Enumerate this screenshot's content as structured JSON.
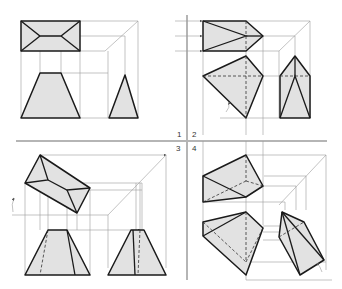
{
  "diagram": {
    "type": "orthographic-projection-steps",
    "quadrants": [
      {
        "id": 1,
        "label": "1",
        "content": "Initial top view (rectangle with frustum edges), front view (trapezoid), side view (triangle)"
      },
      {
        "id": 2,
        "label": "2",
        "content": "Rotated top view (pentagon), rotated front view (quadrilateral), side view (prism with triangle)"
      },
      {
        "id": 3,
        "label": "3",
        "content": "Tilted top view (rotated box), front view trapezoid with hidden edge, side view trapezoid with hidden edge"
      },
      {
        "id": 4,
        "label": "4",
        "content": "Final oblique views: top, front and side projections with hidden edges"
      }
    ],
    "colors": {
      "object_fill": "#e2e2e2",
      "object_stroke": "#1a1a1a",
      "projection_lines": "#9a9a9a",
      "divider": "#b5b5b5",
      "background": "#ffffff"
    }
  }
}
